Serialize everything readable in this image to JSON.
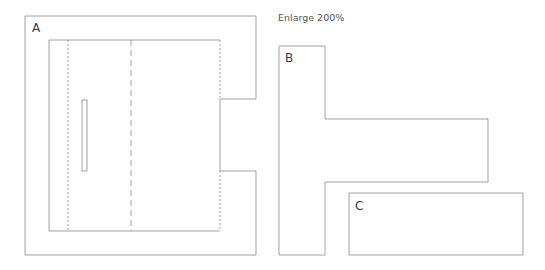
{
  "diagram": {
    "note": "Enlarge 200%",
    "pieces": [
      {
        "id": "A",
        "label": "A"
      },
      {
        "id": "B",
        "label": "B"
      },
      {
        "id": "C",
        "label": "C"
      }
    ],
    "colors": {
      "line": "#8a8a8a",
      "background": "#ffffff"
    }
  }
}
